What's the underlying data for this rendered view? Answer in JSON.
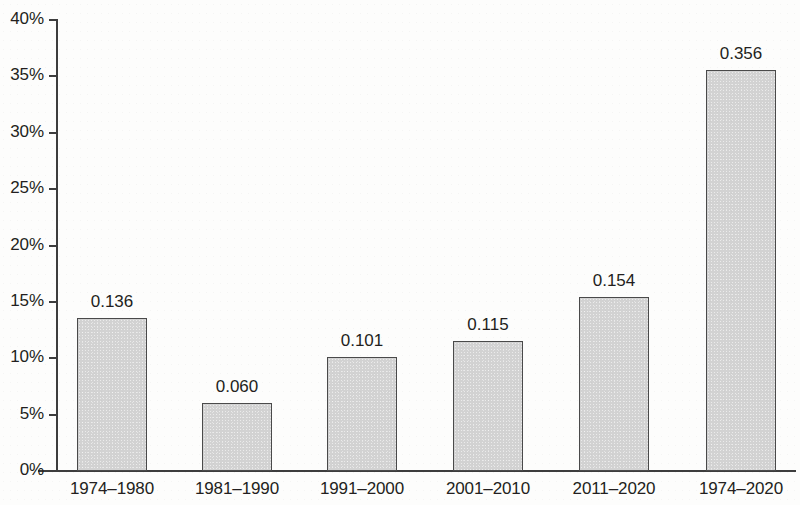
{
  "chart_data": {
    "type": "bar",
    "title": "",
    "subtitle": "",
    "xlabel": "",
    "ylabel": "",
    "categories": [
      "1974–1980",
      "1981–1990",
      "1991–2000",
      "2001–2010",
      "2011–2020",
      "1974–2020"
    ],
    "values": [
      0.136,
      0.06,
      0.101,
      0.115,
      0.154,
      0.356
    ],
    "data_labels": [
      "0.136",
      "0.060",
      "0.101",
      "0.115",
      "0.154",
      "0.356"
    ],
    "ylim": [
      0,
      0.4
    ],
    "y_tick_values": [
      0,
      0.05,
      0.1,
      0.15,
      0.2,
      0.25,
      0.3,
      0.35,
      0.4
    ],
    "y_tick_labels": [
      "0%",
      "5%",
      "10%",
      "15%",
      "20%",
      "25%",
      "30%",
      "35%",
      "40%"
    ],
    "grid": false,
    "legend": false,
    "legend_position": "none",
    "series": [
      {
        "name": "",
        "values": [
          0.136,
          0.06,
          0.101,
          0.115,
          0.154,
          0.356
        ]
      }
    ],
    "colors": {
      "bar_fill": "#d2d2d2",
      "bar_border": "#4a4a4a",
      "axis": "#3d3d3d",
      "text": "#231f20",
      "background": "#fdfdfc"
    }
  },
  "axis": {
    "y_labels": [
      "40%",
      "35%",
      "30%",
      "25%",
      "20%",
      "15%",
      "10%",
      "5%",
      "0%"
    ]
  }
}
